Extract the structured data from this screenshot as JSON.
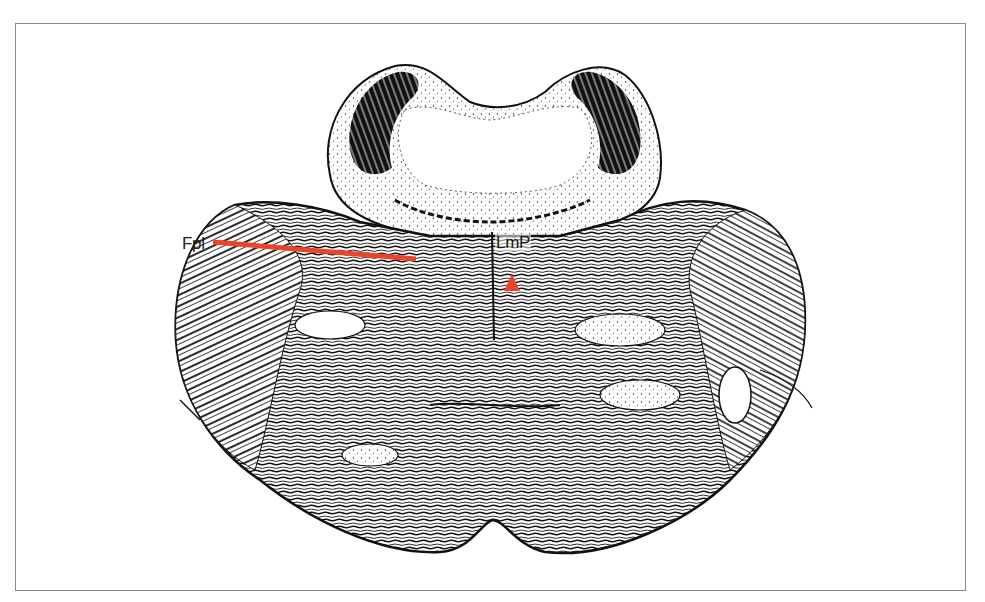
{
  "figure": {
    "frame_color": "#8a8a8a",
    "background": "#ffffff",
    "ink_color": "#111111",
    "annotation_color": "#e8452c"
  },
  "annotations": {
    "fpl": {
      "label": "Fpl",
      "marker": "leader-line",
      "line_start": [
        213,
        242
      ],
      "line_end": [
        416,
        259
      ]
    },
    "lmp": {
      "label": "LmP",
      "marker": "triangle-arrowhead",
      "marker_position": [
        512,
        284
      ]
    }
  }
}
